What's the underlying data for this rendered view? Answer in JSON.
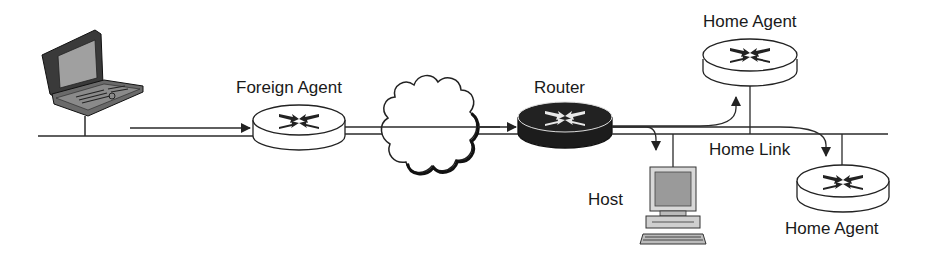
{
  "diagram": {
    "type": "network-topology",
    "nodes": [
      {
        "id": "mobile-node",
        "kind": "laptop",
        "label": ""
      },
      {
        "id": "foreign-agent",
        "kind": "router",
        "label": "Foreign Agent"
      },
      {
        "id": "internet",
        "kind": "cloud",
        "label": ""
      },
      {
        "id": "router",
        "kind": "router-dark",
        "label": "Router"
      },
      {
        "id": "host",
        "kind": "desktop",
        "label": "Host"
      },
      {
        "id": "home-agent-1",
        "kind": "router",
        "label": "Home Agent"
      },
      {
        "id": "home-agent-2",
        "kind": "router",
        "label": "Home Agent"
      }
    ],
    "links": [
      {
        "name": "foreign-link",
        "label": ""
      },
      {
        "name": "home-link",
        "label": "Home Link"
      }
    ],
    "flows": [
      {
        "from": "mobile-node",
        "to": "foreign-agent"
      },
      {
        "from": "foreign-agent",
        "to": "router"
      },
      {
        "from": "router",
        "to": "host"
      },
      {
        "from": "router",
        "to": "home-agent-1"
      },
      {
        "from": "router",
        "to": "home-agent-2"
      }
    ]
  },
  "labels": {
    "foreign_agent": "Foreign Agent",
    "router": "Router",
    "home_agent_top": "Home Agent",
    "home_link": "Home Link",
    "host": "Host",
    "home_agent_bottom": "Home Agent"
  },
  "colors": {
    "line": "#2a2a2a",
    "router_fill": "#ffffff",
    "router_dark_fill": "#1c1c1c",
    "screen": "#9a9a9a",
    "device_body": "#555555"
  }
}
